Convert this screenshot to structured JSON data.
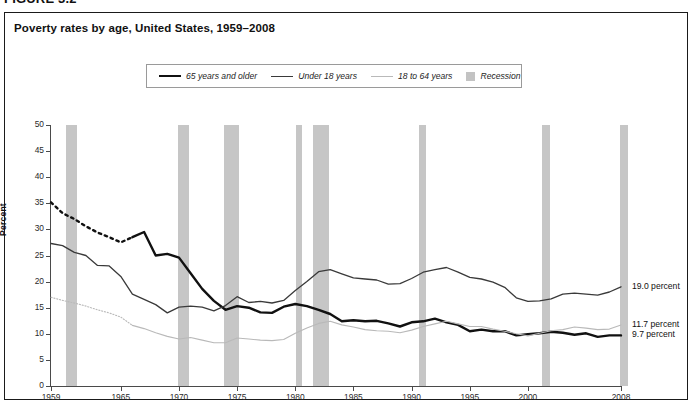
{
  "figure": {
    "number": "FIGURE 3.2",
    "title": "Poverty rates by age, United States, 1959–2008",
    "source": ""
  },
  "legend": {
    "items": [
      {
        "label": "65 years and older",
        "style": "thick",
        "color": "#111111"
      },
      {
        "label": "Under 18 years",
        "style": "mid",
        "color": "#3a3a3a"
      },
      {
        "label": "18 to 64 years",
        "style": "light",
        "color": "#b9b9b9"
      },
      {
        "label": "Recession",
        "style": "swatch",
        "color": "#c3c3c3"
      }
    ]
  },
  "annotations": [
    {
      "text": "19.0 percent",
      "series": "Under 18 years",
      "value": 19.0
    },
    {
      "text": "11.7 percent",
      "series": "18 to 64 years",
      "value": 11.7
    },
    {
      "text": "9.7 percent",
      "series": "65 years and older",
      "value": 9.7
    }
  ],
  "chart_data": {
    "type": "line",
    "title": "Poverty rates by age, United States, 1959–2008",
    "xlabel": "",
    "ylabel": "Percent",
    "ylim": [
      0,
      50
    ],
    "ytick_values": [
      0,
      5,
      10,
      15,
      20,
      25,
      30,
      35,
      40,
      45,
      50
    ],
    "xlim": [
      1959,
      2008
    ],
    "xtick_values": [
      1959,
      1965,
      1970,
      1975,
      1980,
      1985,
      1990,
      1995,
      2000,
      2008
    ],
    "grid": false,
    "legend_position": "top-center",
    "x": [
      1959,
      1960,
      1961,
      1962,
      1963,
      1964,
      1965,
      1966,
      1967,
      1968,
      1969,
      1970,
      1971,
      1972,
      1973,
      1974,
      1975,
      1976,
      1977,
      1978,
      1979,
      1980,
      1981,
      1982,
      1983,
      1984,
      1985,
      1986,
      1987,
      1988,
      1989,
      1990,
      1991,
      1992,
      1993,
      1994,
      1995,
      1996,
      1997,
      1998,
      1999,
      2000,
      2001,
      2002,
      2003,
      2004,
      2005,
      2006,
      2007,
      2008
    ],
    "series": [
      {
        "name": "65 years and older",
        "color": "#111111",
        "width": 2.4,
        "dashed_through": 1966,
        "values": [
          35.2,
          33.1,
          32.0,
          30.6,
          29.4,
          28.5,
          27.5,
          28.5,
          29.5,
          25.0,
          25.3,
          24.6,
          21.6,
          18.6,
          16.3,
          14.6,
          15.3,
          15.0,
          14.1,
          14.0,
          15.2,
          15.7,
          15.3,
          14.6,
          13.8,
          12.4,
          12.6,
          12.4,
          12.5,
          12.0,
          11.4,
          12.2,
          12.4,
          12.9,
          12.2,
          11.7,
          10.5,
          10.8,
          10.5,
          10.5,
          9.7,
          9.9,
          10.1,
          10.4,
          10.2,
          9.8,
          10.1,
          9.4,
          9.7,
          9.7
        ]
      },
      {
        "name": "Under 18 years",
        "color": "#3a3a3a",
        "width": 1.3,
        "dashed_through": null,
        "values": [
          27.3,
          26.9,
          25.6,
          25.0,
          23.1,
          23.0,
          21.0,
          17.6,
          16.6,
          15.6,
          14.0,
          15.1,
          15.3,
          15.1,
          14.4,
          15.4,
          17.1,
          16.0,
          16.2,
          15.9,
          16.4,
          18.3,
          20.0,
          21.9,
          22.3,
          21.5,
          20.7,
          20.5,
          20.3,
          19.5,
          19.6,
          20.6,
          21.8,
          22.3,
          22.7,
          21.8,
          20.8,
          20.5,
          19.9,
          18.9,
          16.9,
          16.2,
          16.3,
          16.7,
          17.6,
          17.8,
          17.6,
          17.4,
          18.0,
          19.0
        ]
      },
      {
        "name": "18 to 64 years",
        "color": "#b9b9b9",
        "width": 1.1,
        "dashed_through": 1966,
        "values": [
          17.0,
          16.4,
          15.9,
          15.3,
          14.6,
          14.0,
          13.2,
          11.6,
          11.0,
          10.2,
          9.5,
          9.0,
          9.3,
          8.8,
          8.3,
          8.3,
          9.2,
          9.0,
          8.8,
          8.7,
          8.9,
          10.1,
          11.1,
          12.0,
          12.4,
          11.7,
          11.3,
          10.8,
          10.6,
          10.5,
          10.2,
          10.7,
          11.4,
          11.9,
          12.4,
          11.9,
          11.4,
          11.4,
          10.9,
          10.5,
          10.0,
          9.6,
          10.1,
          10.6,
          10.8,
          11.3,
          11.1,
          10.8,
          10.9,
          11.7
        ]
      }
    ],
    "recessions": [
      {
        "start": 1960.3,
        "end": 1961.2
      },
      {
        "start": 1969.9,
        "end": 1970.9
      },
      {
        "start": 1973.9,
        "end": 1975.2
      },
      {
        "start": 1980.1,
        "end": 1980.6
      },
      {
        "start": 1981.5,
        "end": 1982.9
      },
      {
        "start": 1990.6,
        "end": 1991.2
      },
      {
        "start": 2001.2,
        "end": 2001.9
      },
      {
        "start": 2007.9,
        "end": 2008.6
      }
    ]
  }
}
